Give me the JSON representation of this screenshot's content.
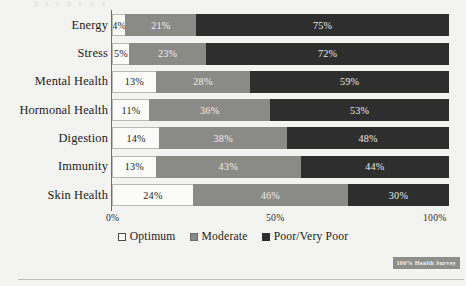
{
  "page": {
    "top_cut_text": "p     t    y                                   p           y    g  y",
    "watermark": "100% Health Survey"
  },
  "chart_data": {
    "type": "bar",
    "orientation": "horizontal",
    "stacked": true,
    "normalized": "100%",
    "title": "",
    "xlabel": "",
    "ylabel": "",
    "xlim": [
      0,
      100
    ],
    "xticks": [
      "0%",
      "50%",
      "100%"
    ],
    "xtick_values": [
      0,
      50,
      100
    ],
    "grid": false,
    "legend_position": "bottom",
    "categories": [
      "Energy",
      "Stress",
      "Mental Health",
      "Hormonal Health",
      "Digestion",
      "Immunity",
      "Skin Health"
    ],
    "series": [
      {
        "name": "Optimum",
        "color": "#fbfbf9",
        "values": [
          4,
          5,
          13,
          11,
          14,
          13,
          24
        ],
        "labels": [
          "4%",
          "5%",
          "13%",
          "11%",
          "14%",
          "13%",
          "24%"
        ]
      },
      {
        "name": "Moderate",
        "color": "#8a8a87",
        "values": [
          21,
          23,
          28,
          36,
          38,
          43,
          46
        ],
        "labels": [
          "21%",
          "23%",
          "28%",
          "36%",
          "38%",
          "43%",
          "46%"
        ]
      },
      {
        "name": "Poor/Very Poor",
        "color": "#2e2e2e",
        "values": [
          75,
          72,
          59,
          53,
          48,
          44,
          30
        ],
        "labels": [
          "75%",
          "72%",
          "59%",
          "53%",
          "48%",
          "44%",
          "30%"
        ]
      }
    ]
  }
}
